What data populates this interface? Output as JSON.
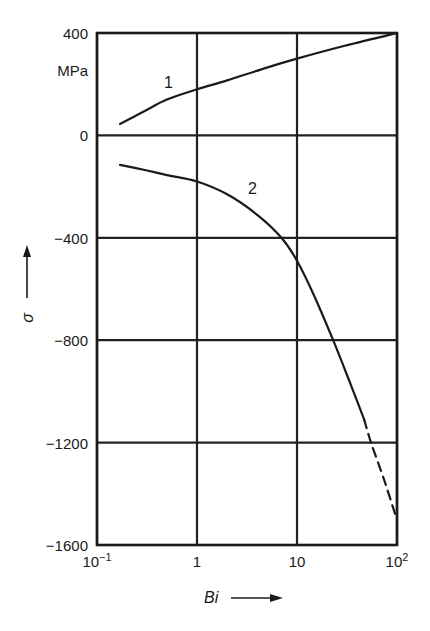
{
  "chart_data": {
    "type": "line",
    "title": "",
    "xlabel": "Bi",
    "ylabel": "σ",
    "y_unit": "MPa",
    "x_scale": "log",
    "xlim": [
      0.1,
      100
    ],
    "ylim": [
      -1600,
      400
    ],
    "grid": true,
    "x_ticks": [
      {
        "value": 0.1,
        "base": "10",
        "exp": "−1"
      },
      {
        "value": 1,
        "base": "1",
        "exp": ""
      },
      {
        "value": 10,
        "base": "10",
        "exp": ""
      },
      {
        "value": 100,
        "base": "10",
        "exp": "2"
      }
    ],
    "y_ticks": [
      "400",
      "0",
      "−400",
      "−800",
      "−1200",
      "−1600"
    ],
    "y_tick_values": [
      400,
      0,
      -400,
      -800,
      -1200,
      -1600
    ],
    "series": [
      {
        "name": "1",
        "style": "solid",
        "points": [
          [
            0.17,
            45
          ],
          [
            0.3,
            95
          ],
          [
            0.5,
            140
          ],
          [
            1,
            180
          ],
          [
            2,
            215
          ],
          [
            5,
            265
          ],
          [
            10,
            300
          ],
          [
            30,
            350
          ],
          [
            100,
            400
          ]
        ]
      },
      {
        "name": "2",
        "style": "solid",
        "points": [
          [
            0.17,
            -115
          ],
          [
            0.3,
            -135
          ],
          [
            0.5,
            -155
          ],
          [
            1,
            -180
          ],
          [
            2,
            -230
          ],
          [
            4,
            -310
          ],
          [
            7,
            -400
          ],
          [
            10,
            -490
          ],
          [
            15,
            -630
          ],
          [
            23,
            -800
          ],
          [
            35,
            -980
          ],
          [
            47,
            -1110
          ]
        ]
      },
      {
        "name": "2 (extrapolated)",
        "style": "dashed",
        "points": [
          [
            47,
            -1110
          ],
          [
            55,
            -1200
          ],
          [
            75,
            -1350
          ],
          [
            96,
            -1480
          ]
        ]
      }
    ],
    "annotations": [
      {
        "text": "1",
        "x": 0.6,
        "y": 245
      },
      {
        "text": "2",
        "x": 5,
        "y": -215
      }
    ]
  },
  "labels": {
    "unit": "MPa",
    "x_axis": "Bi",
    "y_axis": "σ",
    "curve1": "1",
    "curve2": "2"
  }
}
